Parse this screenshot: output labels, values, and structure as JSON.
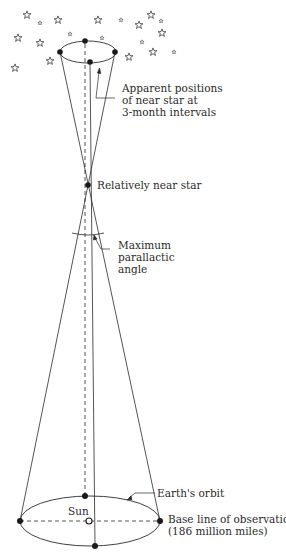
{
  "labels": {
    "apparent_positions": [
      "Apparent positions",
      "of near star at",
      "3-month intervals"
    ],
    "near_star": "Relatively near star",
    "parallactic_angle": [
      "Maximum",
      "parallactic",
      "angle"
    ],
    "earths_orbit": "Earth's orbit",
    "sun": "Sun",
    "base_line": [
      "Base line of observation",
      "(186 million miles)"
    ]
  },
  "colors": {
    "ink": "#2a2a2a",
    "background": "#ffffff"
  },
  "geometry": {
    "near_star": {
      "x": 88,
      "y": 185
    },
    "small_orbit": {
      "cx": 88,
      "cy": 52,
      "rx": 28,
      "ry": 11
    },
    "large_orbit": {
      "cx": 90,
      "cy": 521,
      "rx": 70,
      "ry": 25
    },
    "sun": {
      "x": 89,
      "y": 520
    }
  },
  "star_field": [
    {
      "x": 27,
      "y": 15,
      "size": "large"
    },
    {
      "x": 40,
      "y": 23,
      "size": "small"
    },
    {
      "x": 58,
      "y": 20,
      "size": "large"
    },
    {
      "x": 18,
      "y": 38,
      "size": "large"
    },
    {
      "x": 40,
      "y": 43,
      "size": "large"
    },
    {
      "x": 50,
      "y": 61,
      "size": "large"
    },
    {
      "x": 15,
      "y": 68,
      "size": "large"
    },
    {
      "x": 70,
      "y": 34,
      "size": "small"
    },
    {
      "x": 98,
      "y": 20,
      "size": "large"
    },
    {
      "x": 102,
      "y": 38,
      "size": "small"
    },
    {
      "x": 121,
      "y": 20,
      "size": "small"
    },
    {
      "x": 139,
      "y": 25,
      "size": "large"
    },
    {
      "x": 151,
      "y": 15,
      "size": "large"
    },
    {
      "x": 161,
      "y": 21,
      "size": "small"
    },
    {
      "x": 162,
      "y": 33,
      "size": "large"
    },
    {
      "x": 142,
      "y": 42,
      "size": "small"
    },
    {
      "x": 153,
      "y": 52,
      "size": "large"
    },
    {
      "x": 174,
      "y": 52,
      "size": "small"
    },
    {
      "x": 129,
      "y": 57,
      "size": "large"
    }
  ]
}
